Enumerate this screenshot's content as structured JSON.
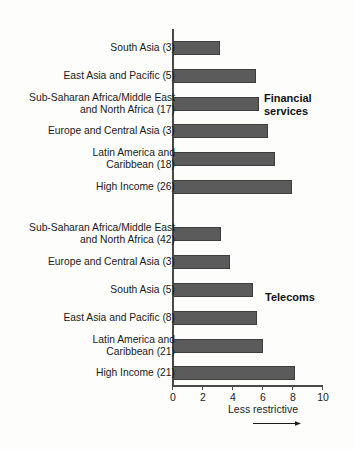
{
  "chart_data": {
    "type": "bar",
    "orientation": "horizontal",
    "title": "",
    "subtitle": "",
    "xlabel": "Less restrictive",
    "ylabel": "",
    "xlim": [
      0,
      10
    ],
    "xticks": [
      0,
      2,
      4,
      6,
      8,
      10
    ],
    "xticklabels": [
      "0",
      "2",
      "4",
      "6",
      "8",
      "10"
    ],
    "grid": false,
    "legend": "none",
    "groups": [
      {
        "name": "Financial services",
        "annotation_lines": [
          "Financial",
          "services"
        ],
        "categories": [
          "South Asia (3)",
          "East Asia and Pacific (5)",
          "Sub-Saharan Africa/Middle East and North Africa (17)",
          "Europe and Central Asia (3)",
          "Latin America and Caribbean (18)",
          "High Income (26)"
        ],
        "values": [
          3.1,
          5.5,
          5.7,
          6.3,
          6.8,
          7.9
        ]
      },
      {
        "name": "Telecoms",
        "annotation_lines": [
          "Telecoms"
        ],
        "categories": [
          "Sub-Saharan Africa/Middle East and North Africa (42)",
          "Europe and Central Asia (3)",
          "South Asia (5)",
          "East Asia and Pacific (8)",
          "Latin America and Caribbean (21)",
          "High Income (21)"
        ],
        "values": [
          3.2,
          3.8,
          5.3,
          5.6,
          6.0,
          8.1
        ]
      }
    ],
    "colors": {
      "bar_fill": "#5b5b5b",
      "bar_edge": "#3d3d3d",
      "axis": "#4a4a4a",
      "text": "#1a1a1a",
      "background": "#fdfdfc"
    }
  },
  "labels": {
    "fin_0_line1": "South Asia (3)",
    "fin_0_line2": "",
    "fin_1_line1": "East Asia and Pacific (5)",
    "fin_1_line2": "",
    "fin_2_line1": "Sub-Saharan Africa/Middle East",
    "fin_2_line2": "and North Africa (17)",
    "fin_3_line1": "Europe and Central Asia (3)",
    "fin_3_line2": "",
    "fin_4_line1": "Latin America and",
    "fin_4_line2": "Caribbean (18)",
    "fin_5_line1": "High Income (26)",
    "fin_5_line2": "",
    "tel_0_line1": "Sub-Saharan Africa/Middle East",
    "tel_0_line2": "and North Africa (42)",
    "tel_1_line1": "Europe and Central Asia (3)",
    "tel_1_line2": "",
    "tel_2_line1": "South Asia (5)",
    "tel_2_line2": "",
    "tel_3_line1": "East Asia and Pacific (8)",
    "tel_3_line2": "",
    "tel_4_line1": "Latin America and",
    "tel_4_line2": "Caribbean (21)",
    "tel_5_line1": "High Income (21)",
    "tel_5_line2": ""
  },
  "annotations": {
    "financial_line1": "Financial",
    "financial_line2": "services",
    "telecoms": "Telecoms"
  },
  "axis": {
    "tick_0": "0",
    "tick_2": "2",
    "tick_4": "4",
    "tick_6": "6",
    "tick_8": "8",
    "tick_10": "10",
    "caption": "Less restrictive"
  }
}
